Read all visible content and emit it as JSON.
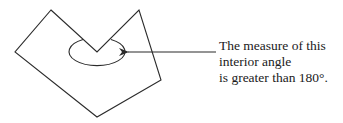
{
  "diagram": {
    "polygon": {
      "vertices": [
        [
          51,
          10
        ],
        [
          97,
          52
        ],
        [
          139,
          10
        ],
        [
          161,
          80
        ],
        [
          97,
          117
        ],
        [
          15,
          52
        ]
      ],
      "reflex_vertex": [
        97,
        52
      ],
      "stroke": "#2b2b2b"
    },
    "angle_marker": {
      "shape": "ellipse",
      "cx": 97,
      "cy": 53,
      "rx": 28,
      "ry": 14
    },
    "arrow": {
      "from": [
        216,
        52
      ],
      "to": [
        127,
        52
      ]
    },
    "annotation": {
      "lines": [
        "The measure of this",
        "interior angle",
        "is greater than 180°."
      ]
    }
  }
}
